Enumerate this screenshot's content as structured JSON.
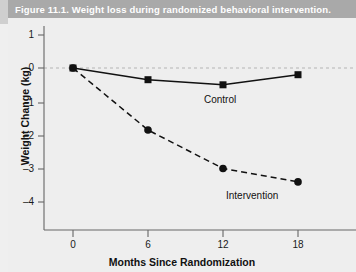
{
  "figure": {
    "caption": "Figure 11.1. Weight loss during randomized behavioral intervention."
  },
  "chart_data": {
    "type": "line",
    "title": "",
    "xlabel": "Months Since Randomization",
    "ylabel": "Weight Change (kg)",
    "x": [
      0,
      6,
      12,
      18
    ],
    "xtick_labels": [
      "0",
      "6",
      "12",
      "18"
    ],
    "ytick_values": [
      1,
      0,
      -1,
      -2,
      -3,
      -4
    ],
    "ytick_labels": [
      "1",
      "0",
      "–1",
      "–2",
      "–3",
      "–4"
    ],
    "xlim": [
      -2,
      21
    ],
    "ylim": [
      -4.6,
      1.35
    ],
    "grid": false,
    "zero_reference_line": {
      "value": 0,
      "style": "dashed",
      "color": "#b4b4b4"
    },
    "legend": "inline-labels",
    "series": [
      {
        "name": "Control",
        "values": [
          0,
          -0.35,
          -0.5,
          -0.2
        ],
        "line_style": "solid",
        "marker": "square",
        "color": "#111111",
        "label_text": "Control"
      },
      {
        "name": "Intervention",
        "values": [
          0,
          -1.85,
          -3.0,
          -3.4
        ],
        "line_style": "dashed",
        "marker": "circle",
        "color": "#111111",
        "label_text": "Intervention"
      }
    ]
  },
  "colors": {
    "title_bar": "#a9a9a9",
    "title_text": "#ffffff",
    "panel_background": "#eeeeee",
    "axis": "#5a5a5a",
    "data": "#111111"
  }
}
